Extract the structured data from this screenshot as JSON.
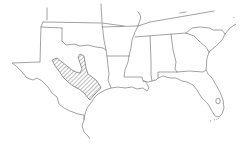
{
  "map": {
    "type": "outline-map",
    "area": "South-central and southeastern United States",
    "states_shown": [
      "Texas",
      "Oklahoma",
      "Arkansas",
      "Louisiana",
      "Mississippi",
      "Alabama",
      "Georgia",
      "Florida",
      "South Carolina",
      "Tennessee",
      "North Carolina"
    ],
    "highlighted_region": {
      "description": "Hatched range in central Texas",
      "pattern": "diagonal-hatch",
      "color": "#6e6e6e"
    },
    "colors": {
      "background": "#ffffff",
      "border": "#8a8a8a",
      "hatch": "#6e6e6e"
    }
  }
}
